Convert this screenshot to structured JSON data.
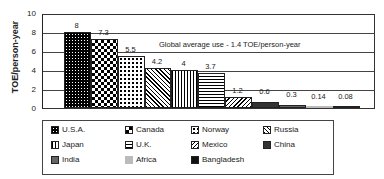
{
  "chart_data": {
    "type": "bar",
    "title": "",
    "xlabel": "",
    "ylabel": "TOE/person-year",
    "ylim": [
      0,
      10
    ],
    "yticks": [
      "0",
      "2",
      "4",
      "6",
      "8",
      "10"
    ],
    "grid": true,
    "legend_position": "bottom",
    "categories": [
      "U.S.A.",
      "Canada",
      "Norway",
      "Russia",
      "Japan",
      "U.K.",
      "Mexico",
      "China",
      "India",
      "Africa",
      "Bangladesh"
    ],
    "values": [
      8,
      7.3,
      5.5,
      4.2,
      4,
      3.7,
      1.2,
      0.6,
      0.3,
      0.14,
      0.08
    ],
    "value_labels": [
      "8",
      "7.3",
      "5.5",
      "4.2",
      "4",
      "3.7",
      "1.2",
      "0.6",
      "0.3",
      "0.14",
      "0.08"
    ],
    "annotations": [
      "Global average use - 1.4 TOE/person-year"
    ]
  },
  "legend": {
    "items": [
      {
        "label": "U.S.A.",
        "pattern": "p-usa"
      },
      {
        "label": "Canada",
        "pattern": "p-canada"
      },
      {
        "label": "Norway",
        "pattern": "p-norway"
      },
      {
        "label": "Russia",
        "pattern": "p-russia"
      },
      {
        "label": "Japan",
        "pattern": "p-japan"
      },
      {
        "label": "U.K.",
        "pattern": "p-uk"
      },
      {
        "label": "Mexico",
        "pattern": "p-mexico"
      },
      {
        "label": "China",
        "pattern": "p-china"
      },
      {
        "label": "India",
        "pattern": "p-india"
      },
      {
        "label": "Africa",
        "pattern": "p-africa"
      },
      {
        "label": "Bangladesh",
        "pattern": "p-bangladesh"
      }
    ]
  }
}
